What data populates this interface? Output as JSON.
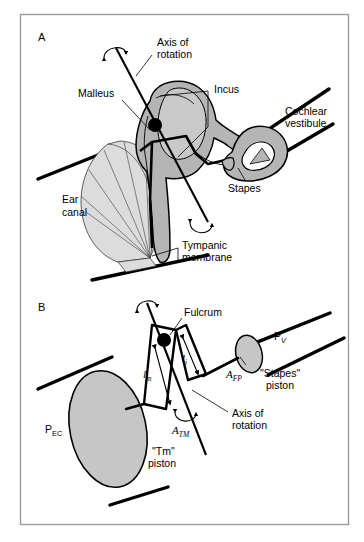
{
  "figure": {
    "domain": "anatomy-biomechanics-diagram",
    "title_visible": false,
    "width": 364,
    "height": 542,
    "frame": {
      "stroke": "#9a9a9a",
      "fill": "#ffffff"
    }
  },
  "colors": {
    "ossicle_gray": "#b5b5b5",
    "ossicle_gray_light": "#c9c9c9",
    "membrane_gray": "#dcdcdc",
    "piston_gray": "#c6c6c6",
    "line_black": "#000000",
    "thin_line": "#1a1a1a",
    "frame_gray": "#9a9a9a",
    "white": "#ffffff"
  },
  "panels": [
    {
      "id": "A",
      "label": "A",
      "labels": [
        {
          "name": "axis-of-rotation",
          "lines": [
            "Axis of",
            "rotation"
          ]
        },
        {
          "name": "malleus",
          "lines": [
            "Malleus"
          ]
        },
        {
          "name": "incus",
          "lines": [
            "Incus"
          ]
        },
        {
          "name": "cochlear-vestibule",
          "lines": [
            "Cochlear",
            "vestibule"
          ]
        },
        {
          "name": "stapes",
          "lines": [
            "Stapes"
          ]
        },
        {
          "name": "ear-canal",
          "lines": [
            "Ear",
            "canal"
          ]
        },
        {
          "name": "tympanic-membrane",
          "lines": [
            "Tympanic",
            "membrane"
          ]
        }
      ]
    },
    {
      "id": "B",
      "label": "B",
      "labels": [
        {
          "name": "fulcrum",
          "lines": [
            "Fulcrum"
          ]
        },
        {
          "name": "axis-of-rotation",
          "lines": [
            "Axis of",
            "rotation"
          ]
        },
        {
          "name": "stapes-piston",
          "lines": [
            "\"Stapes\"",
            "piston"
          ]
        },
        {
          "name": "tm-piston",
          "lines": [
            "\"Tm\"",
            "piston"
          ]
        }
      ],
      "symbols": [
        {
          "name": "pressure-vestibule",
          "base": "P",
          "sub": "V"
        },
        {
          "name": "pressure-ear-canal",
          "base": "P",
          "sub": "EC"
        },
        {
          "name": "area-footplate",
          "base": "A",
          "sub": "FP"
        },
        {
          "name": "area-tympanic-membrane",
          "base": "A",
          "sub": "TM"
        },
        {
          "name": "lever-arm-malleus",
          "base": "l",
          "sub": "m"
        },
        {
          "name": "lever-arm-incus",
          "base": "l",
          "sub": "i"
        }
      ]
    }
  ],
  "text": {
    "panel_a": "A",
    "panel_b": "B",
    "axis_of": "Axis of",
    "rotation": "rotation",
    "malleus": "Malleus",
    "incus": "Incus",
    "cochlear": "Cochlear",
    "vestibule": "vestibule",
    "stapes": "Stapes",
    "ear": "Ear",
    "canal": "canal",
    "tympanic": "Tympanic",
    "membrane": "membrane",
    "fulcrum": "Fulcrum",
    "stapes_piston_q": "\"Stapes\"",
    "piston": "piston",
    "tm_piston_q": "\"Tm\"",
    "piston2": "piston",
    "p_base": "P",
    "p_v_sub": "V",
    "p_ec_sub": "EC",
    "a_base": "A",
    "a_fp_sub": "FP",
    "a_tm_sub": "TM",
    "l_base": "l",
    "l_m_sub": "m",
    "l_i_sub": "i",
    "axis_of_b": "Axis of",
    "rotation_b": "rotation"
  }
}
